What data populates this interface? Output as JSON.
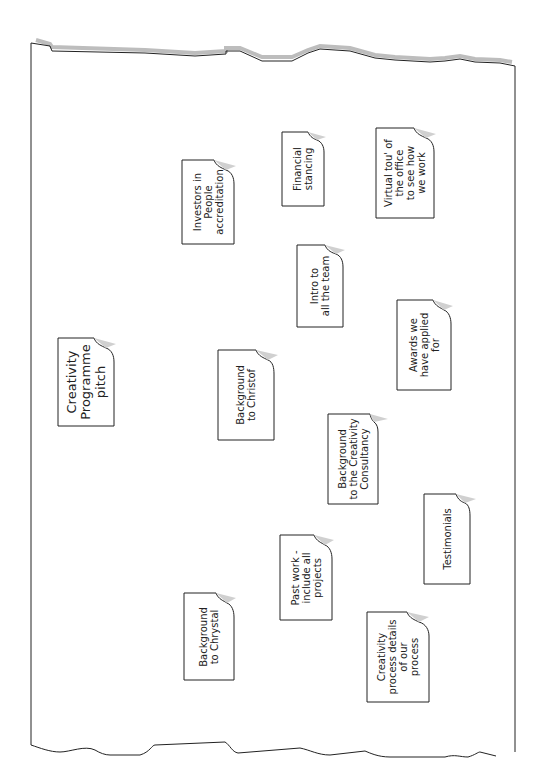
{
  "diagram": {
    "type": "brainstorm-sticky-notes",
    "orientation": "rotated-90-ccw",
    "central_topic": "Creativity Programme pitch",
    "notes": [
      {
        "id": "creativity-programme-pitch",
        "text": "Creativity\nProgramme\npitch",
        "central": true
      },
      {
        "id": "investors-in-people",
        "text": "Investors in\nPeople\naccreditation"
      },
      {
        "id": "financial-standing",
        "text": "Financial\nstancing"
      },
      {
        "id": "virtual-tour",
        "text": "Virtual tou' of\nthe office\nto see how\nwe work"
      },
      {
        "id": "intro-to-team",
        "text": "Intro to\nall the team"
      },
      {
        "id": "awards",
        "text": "Awards we\nhave applied\nfor"
      },
      {
        "id": "background-christof",
        "text": "Background\nto Christof"
      },
      {
        "id": "background-consultancy",
        "text": "Background\nto the Creativity\nConsultancy"
      },
      {
        "id": "testimonials",
        "text": "Testimonials"
      },
      {
        "id": "past-work",
        "text": "Past work -\ninclude all\nprojects"
      },
      {
        "id": "background-chrystal",
        "text": "Background\nto Chrystal"
      },
      {
        "id": "creativity-process",
        "text": "Creativity\nprocess details\nof our\nprocess"
      }
    ]
  },
  "colors": {
    "line": "#222222",
    "shadow": "#bdbdbd",
    "paper": "#ffffff",
    "fold": "#d0d0d0"
  }
}
